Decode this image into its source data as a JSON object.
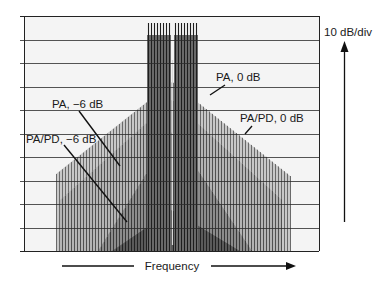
{
  "chart_data": {
    "type": "bar",
    "title": "",
    "xlabel": "Frequency",
    "ylabel": "10 dB/div",
    "grid": true,
    "y_divisions": 10,
    "y_scale_db_per_div": 10,
    "plot": {
      "left": 24,
      "right": 319,
      "top": 16,
      "bottom": 251
    },
    "carriers": {
      "description": "Two-tone carrier groups at center, clipped at top",
      "groups": [
        {
          "x_start": 148,
          "x_end": 170,
          "top": 23
        },
        {
          "x_start": 175,
          "x_end": 197,
          "top": 23
        }
      ],
      "spacing": 3
    },
    "series": [
      {
        "name": "PA, 0 dB",
        "shade": "#c8c8c8",
        "line": "#6a6a6a",
        "envelope": {
          "left_x": 56,
          "left_y": 174,
          "apex_x": 172,
          "apex_y": 82,
          "right_x": 290,
          "right_y": 176
        }
      },
      {
        "name": "PA/PD, 0 dB",
        "shade": "#b4b4b4",
        "line": "#505050",
        "envelope": {
          "left_x": 60,
          "left_y": 200,
          "apex_x": 172,
          "apex_y": 100,
          "right_x": 282,
          "right_y": 200
        }
      },
      {
        "name": "PA, −6 dB",
        "shade": "#8c8c8c",
        "line": "#3a3a3a",
        "envelope": {
          "left_x": 98,
          "left_y": 251,
          "apex_x": 172,
          "apex_y": 132,
          "right_x": 252,
          "right_y": 251
        }
      },
      {
        "name": "PA/PD, −6 dB",
        "shade": "#5a5a5a",
        "line": "#222222",
        "envelope": {
          "left_x": 112,
          "left_y": 251,
          "apex_x": 172,
          "apex_y": 210,
          "right_x": 240,
          "right_y": 251
        }
      }
    ],
    "annotations": [
      {
        "text": "PA, −6 dB",
        "x": 52,
        "y": 108,
        "leader": [
          79,
          111,
          120,
          166
        ]
      },
      {
        "text": "PA/PD, −6 dB",
        "x": 26,
        "y": 143,
        "leader": [
          64,
          145,
          127,
          222
        ]
      },
      {
        "text": "PA, 0 dB",
        "x": 216,
        "y": 81,
        "leader": [
          225,
          85,
          210,
          95
        ]
      },
      {
        "text": "PA/PD, 0 dB",
        "x": 240,
        "y": 122,
        "leader": [
          252,
          126,
          245,
          134
        ]
      }
    ],
    "line_spacing": 3,
    "line_x_start": 56,
    "line_x_end": 290
  },
  "axis": {
    "x_label": "Frequency",
    "y_label": "10 dB/div"
  }
}
